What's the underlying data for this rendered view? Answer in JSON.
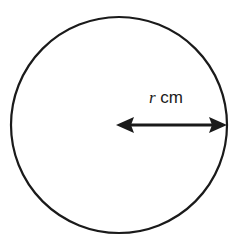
{
  "diagram": {
    "shape": "circle",
    "center": [
      119,
      125
    ],
    "radius": 108,
    "stroke_color": "#1a1a1a",
    "radius_label": {
      "variable": "r",
      "unit": "cm"
    },
    "arrow": "double-headed radius arrow from center to right edge"
  }
}
